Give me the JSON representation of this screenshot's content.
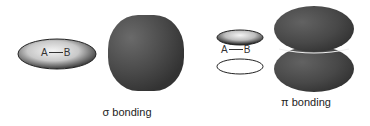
{
  "diagram": {
    "sigma": {
      "atom_a": "A",
      "atom_b": "B",
      "caption": "σ bonding"
    },
    "pi": {
      "atom_a": "A",
      "atom_b": "B",
      "caption": "π bonding"
    },
    "colors": {
      "orbital_dark": "#4a4a4a",
      "orbital_highlight": "#f2f2f2",
      "outline": "#222222",
      "background": "#ffffff"
    }
  }
}
